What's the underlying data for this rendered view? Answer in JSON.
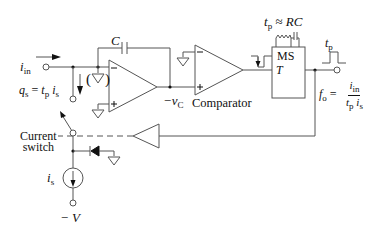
{
  "diagram": {
    "type": "circuit-schematic",
    "stroke_color": "#555555",
    "text_color": "#111111",
    "labels": {
      "input_current": "i",
      "input_current_sub": "in",
      "charge_lhs": "q",
      "charge_lhs_sub": "s",
      "charge_eq": " = ",
      "charge_tp": "t",
      "charge_tp_sub": "p",
      "charge_is": " i",
      "charge_is_sub": "s",
      "capacitor": "C",
      "virtual_ground": "(▽)",
      "integrator_output": "−v",
      "integrator_output_sub": "C",
      "comparator": "Comparator",
      "monostable": "MS",
      "trigger": "T",
      "pulse_width_t": "t",
      "pulse_width_sub": "p",
      "pulse_approx": " ≈ ",
      "pulse_rc": "RC",
      "output_pulse_t": "t",
      "output_pulse_sub": "p",
      "freq_lhs": "f",
      "freq_lhs_sub": "o",
      "freq_eq": " = ",
      "freq_num": "i",
      "freq_num_sub": "in",
      "freq_den_t": "t",
      "freq_den_t_sub": "p",
      "freq_den_i": " i",
      "freq_den_i_sub": "s",
      "current_switch_line1": "Current",
      "current_switch_line2": "switch",
      "source_current": "i",
      "source_current_sub": "s",
      "supply": "− V"
    },
    "components": [
      {
        "name": "input-terminal",
        "kind": "terminal"
      },
      {
        "name": "integrator-capacitor",
        "kind": "capacitor",
        "label": "C"
      },
      {
        "name": "integrator-opamp",
        "kind": "op-amp"
      },
      {
        "name": "comparator",
        "kind": "comparator"
      },
      {
        "name": "monostable",
        "kind": "one-shot",
        "label": "MS"
      },
      {
        "name": "output-terminal",
        "kind": "terminal"
      },
      {
        "name": "feedback-buffer",
        "kind": "buffer"
      },
      {
        "name": "current-switch",
        "kind": "switch"
      },
      {
        "name": "clamp-diode",
        "kind": "diode"
      },
      {
        "name": "current-source",
        "kind": "current-source",
        "label": "i_s"
      },
      {
        "name": "supply-terminal",
        "kind": "terminal",
        "label": "-V"
      }
    ]
  }
}
